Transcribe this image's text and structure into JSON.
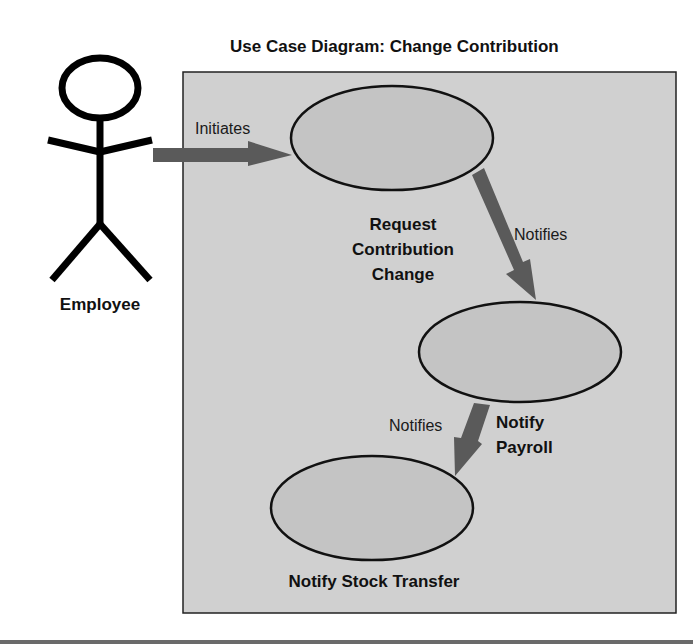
{
  "title": "Use Case Diagram: Change Contribution",
  "actor": {
    "name": "Employee",
    "icon": "stick-figure-icon"
  },
  "use_cases": [
    {
      "id": "uc1",
      "lines": [
        "Request",
        "Contribution",
        "Change"
      ]
    },
    {
      "id": "uc2",
      "lines": [
        "Notify",
        "Payroll"
      ]
    },
    {
      "id": "uc3",
      "lines": [
        "Notify Stock Transfer"
      ]
    }
  ],
  "relations": [
    {
      "from": "Employee",
      "to": "uc1",
      "label": "Initiates"
    },
    {
      "from": "uc1",
      "to": "uc2",
      "label": "Notifies"
    },
    {
      "from": "uc2",
      "to": "uc3",
      "label": "Notifies"
    }
  ],
  "colors": {
    "system_fill": "#d0d0d0",
    "ellipse_fill": "#c4c4c4",
    "arrow": "#5a5a5a",
    "stroke": "#111111"
  }
}
